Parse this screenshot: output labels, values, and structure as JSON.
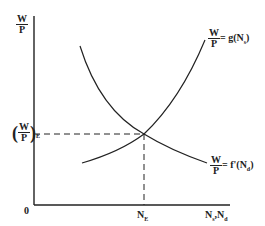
{
  "diagram": {
    "y_axis_label": {
      "num": "W",
      "den": "P"
    },
    "x_axis_label": "N",
    "x_axis_label_subs": [
      "s",
      "d"
    ],
    "origin_label": "0",
    "equilibrium_x_label": "N",
    "equilibrium_x_sub": "E",
    "equilibrium_y_label": {
      "num": "W",
      "den": "P",
      "sub": "E"
    },
    "supply_curve_label": {
      "num": "W",
      "den": "P",
      "rhs": "= g(N",
      "sub": "s",
      "close": ")"
    },
    "demand_curve_label": {
      "num": "W",
      "den": "P",
      "rhs": "= f'(N",
      "sub": "d",
      "close": ")"
    },
    "line_color": "#222222"
  }
}
